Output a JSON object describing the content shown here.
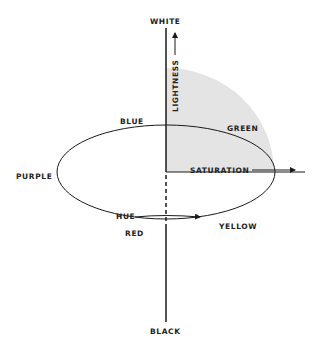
{
  "labels": {
    "white": "WHITE",
    "black": "BLACK",
    "lightness": "LIGHTNESS",
    "blue": "BLUE",
    "green": "GREEN",
    "purple": "PURPLE",
    "saturation": "SATURATION",
    "hue": "HUE",
    "red": "RED",
    "yellow": "YELLOW"
  },
  "colors": {
    "line": "#1a1a1a",
    "shade": "#e4e4e4",
    "background": "#ffffff"
  }
}
